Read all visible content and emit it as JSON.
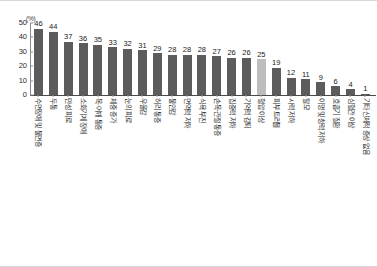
{
  "chart_data": {
    "type": "bar",
    "title": "",
    "subtitle": "",
    "xlabel": "",
    "ylabel": "",
    "unit_label": "(%)",
    "ylim": [
      0,
      50
    ],
    "yticks": [
      50,
      40,
      30,
      20,
      10,
      0
    ],
    "grid": false,
    "legend": "none",
    "highlight_index": 15,
    "categories": [
      "수면장애 및 불면증",
      "두통",
      "만성 피로",
      "소화기계 장애",
      "목·어깨 통증",
      "체중 증가",
      "눈의 피로",
      "우울감",
      "허리 통증",
      "불안감",
      "면역력 저하",
      "식욕 부진",
      "손목·관절 통증",
      "집중력 저하",
      "기억력 감퇴",
      "혈압 이상",
      "피부 트러블",
      "시력 저하",
      "탈모",
      "이명 및 청력 저하",
      "호흡기 질환",
      "심혈관 이상",
      "기타 신체적 증상 없음"
    ],
    "values": [
      46,
      44,
      37,
      36,
      35,
      33,
      32,
      31,
      29,
      28,
      28,
      28,
      27,
      26,
      26,
      25,
      19,
      12,
      11,
      9,
      6,
      4,
      1
    ],
    "bar_colors": {
      "default": "#5c5c5c",
      "highlight": "#bdbdbd"
    },
    "axis_color": "#4a4a4a",
    "background": "#ffffff"
  }
}
